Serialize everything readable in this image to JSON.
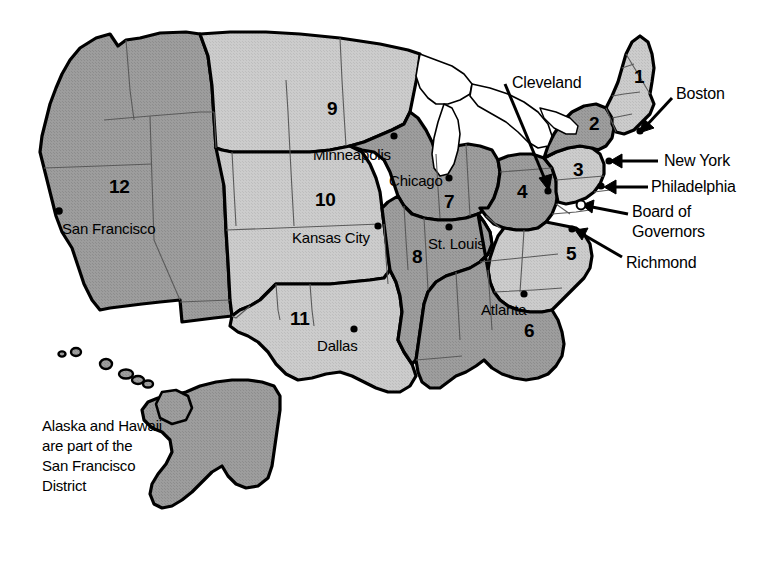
{
  "map": {
    "title": "Federal Reserve Districts Map",
    "background_color": "#ffffff",
    "colors": {
      "light_district": "#c9c9c9",
      "medium_district": "#9a9a9a",
      "water": "#ffffff",
      "outline": "#000000",
      "state_line": "#555555",
      "text": "#000000"
    },
    "districts": [
      {
        "number": "1",
        "bank": "Boston",
        "shade": "light"
      },
      {
        "number": "2",
        "bank": "New York",
        "shade": "medium"
      },
      {
        "number": "3",
        "bank": "Philadelphia",
        "shade": "light"
      },
      {
        "number": "4",
        "bank": "Cleveland",
        "shade": "medium"
      },
      {
        "number": "5",
        "bank": "Richmond",
        "shade": "light"
      },
      {
        "number": "6",
        "bank": "Atlanta",
        "shade": "medium"
      },
      {
        "number": "7",
        "bank": "Chicago",
        "shade": "medium"
      },
      {
        "number": "8",
        "bank": "St. Louis",
        "shade": "medium"
      },
      {
        "number": "9",
        "bank": "Minneapolis",
        "shade": "light"
      },
      {
        "number": "10",
        "bank": "Kansas City",
        "shade": "light"
      },
      {
        "number": "11",
        "bank": "Dallas",
        "shade": "light"
      },
      {
        "number": "12",
        "bank": "San Francisco",
        "shade": "medium"
      }
    ],
    "district_numbers": [
      {
        "label": "1",
        "x": 634,
        "y": 76
      },
      {
        "label": "2",
        "x": 589,
        "y": 123
      },
      {
        "label": "3",
        "x": 573,
        "y": 169
      },
      {
        "label": "4",
        "x": 517,
        "y": 191
      },
      {
        "label": "5",
        "x": 566,
        "y": 253
      },
      {
        "label": "6",
        "x": 524,
        "y": 330
      },
      {
        "label": "7",
        "x": 444,
        "y": 201
      },
      {
        "label": "8",
        "x": 412,
        "y": 256
      },
      {
        "label": "9",
        "x": 327,
        "y": 108
      },
      {
        "label": "10",
        "x": 315,
        "y": 199
      },
      {
        "label": "11",
        "x": 294,
        "y": 318
      },
      {
        "label": "12",
        "x": 113,
        "y": 186
      }
    ],
    "city_labels": [
      {
        "label": "Minneapolis",
        "x": 313,
        "y": 146,
        "dot_x": 394,
        "dot_y": 136
      },
      {
        "label": "Chicago",
        "x": 389,
        "y": 174,
        "dot_x": 449,
        "dot_y": 178
      },
      {
        "label": "Kansas City",
        "x": 292,
        "y": 230,
        "dot_x": 378,
        "dot_y": 226
      },
      {
        "label": "St. Louis",
        "x": 428,
        "y": 239,
        "dot_x": 449,
        "dot_y": 227
      },
      {
        "label": "Dallas",
        "x": 317,
        "y": 339,
        "dot_x": 354,
        "dot_y": 329
      },
      {
        "label": "Atlanta",
        "x": 481,
        "y": 303,
        "dot_x": 524,
        "dot_y": 294
      },
      {
        "label": "San Francisco",
        "x": 64,
        "y": 222,
        "dot_x": 59,
        "dot_y": 211
      }
    ],
    "callouts": [
      {
        "label": "Cleveland",
        "x": 512,
        "y": 77,
        "dot_x": 548,
        "dot_y": 190
      },
      {
        "label": "Boston",
        "x": 678,
        "y": 88,
        "dot_x": 640,
        "dot_y": 131
      },
      {
        "label": "New York",
        "x": 664,
        "y": 157,
        "dot_x": 610,
        "dot_y": 161
      },
      {
        "label": "Philadelphia",
        "x": 653,
        "y": 185,
        "dot_x": 604,
        "dot_y": 186
      },
      {
        "label": "Board of",
        "x": 634,
        "y": 210,
        "dot_x": 0,
        "dot_y": 0
      },
      {
        "label": "Governors",
        "x": 634,
        "y": 230,
        "dot_x": 582,
        "dot_y": 205
      },
      {
        "label": "Richmond",
        "x": 628,
        "y": 261,
        "dot_x": 576,
        "dot_y": 229
      }
    ],
    "note": {
      "line1": "Alaska and Hawaii",
      "line2": "are part of the",
      "line3": "San Francisco",
      "line4": "District",
      "x": 42,
      "y": 423
    }
  }
}
